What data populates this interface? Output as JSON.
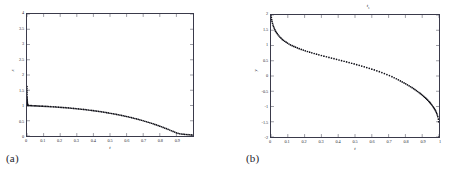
{
  "figure": {
    "background": "#ffffff",
    "ink": "#1a1a1a"
  },
  "panels": [
    {
      "id": "a",
      "caption": "(a)",
      "title": "",
      "chart_data": {
        "type": "scatter",
        "title": "",
        "xlabel": "t",
        "ylabel": "x",
        "xlim": [
          0,
          1
        ],
        "ylim": [
          0,
          4
        ],
        "xticks": [
          0,
          0.1,
          0.2,
          0.3,
          0.4,
          0.5,
          0.6,
          0.7,
          0.8,
          0.9
        ],
        "xticklabels": [
          "0",
          "0.1",
          "0.2",
          "0.3",
          "0.4",
          "0.5",
          "0.6",
          "0.7",
          "0.8",
          "0.9"
        ],
        "yticks": [
          0,
          0.5,
          1,
          1.5,
          2,
          2.5,
          3,
          3.5,
          4
        ],
        "yticklabels": [
          "0",
          "0.5",
          "1",
          "1.5",
          "2",
          "2.5",
          "3",
          "3.5",
          "4"
        ],
        "grid": false,
        "legend": false,
        "marker": "dot",
        "series": [
          {
            "name": "spike",
            "comment": "near-vertical cluster of points at t=0 descending from ~1.62 to ~1.0",
            "x": [
              0.0,
              0.0,
              0.0,
              0.0,
              0.0,
              0.0,
              0.001,
              0.001,
              0.001,
              0.002,
              0.002,
              0.002,
              0.003,
              0.003,
              0.004,
              0.004,
              0.005
            ],
            "y": [
              1.62,
              1.55,
              1.48,
              1.42,
              1.36,
              1.3,
              1.25,
              1.2,
              1.16,
              1.12,
              1.09,
              1.07,
              1.05,
              1.04,
              1.02,
              1.01,
              1.0
            ]
          },
          {
            "name": "decay",
            "comment": "dotted branch from (0,1.0) decaying slowly then steeply to (1,0.03)",
            "x": [
              0.005,
              0.012,
              0.02,
              0.028,
              0.036,
              0.044,
              0.052,
              0.06,
              0.068,
              0.076,
              0.085,
              0.094,
              0.103,
              0.112,
              0.121,
              0.13,
              0.14,
              0.15,
              0.16,
              0.17,
              0.18,
              0.19,
              0.2,
              0.21,
              0.22,
              0.23,
              0.24,
              0.25,
              0.26,
              0.27,
              0.28,
              0.29,
              0.3,
              0.31,
              0.32,
              0.33,
              0.34,
              0.35,
              0.36,
              0.37,
              0.38,
              0.39,
              0.4,
              0.41,
              0.42,
              0.43,
              0.44,
              0.45,
              0.46,
              0.47,
              0.48,
              0.49,
              0.5,
              0.51,
              0.52,
              0.53,
              0.54,
              0.55,
              0.56,
              0.57,
              0.58,
              0.59,
              0.6,
              0.61,
              0.62,
              0.63,
              0.64,
              0.65,
              0.66,
              0.67,
              0.68,
              0.69,
              0.7,
              0.71,
              0.72,
              0.73,
              0.74,
              0.75,
              0.76,
              0.77,
              0.78,
              0.79,
              0.8,
              0.81,
              0.82,
              0.83,
              0.84,
              0.85,
              0.86,
              0.87,
              0.88,
              0.89,
              0.9,
              0.91,
              0.92,
              0.93,
              0.94,
              0.95,
              0.96,
              0.97,
              0.98,
              0.99,
              1.0
            ],
            "y": [
              1.0,
              0.998,
              0.996,
              0.994,
              0.992,
              0.99,
              0.988,
              0.986,
              0.984,
              0.982,
              0.979,
              0.977,
              0.974,
              0.972,
              0.969,
              0.966,
              0.963,
              0.96,
              0.956,
              0.953,
              0.949,
              0.945,
              0.941,
              0.937,
              0.933,
              0.929,
              0.924,
              0.92,
              0.915,
              0.91,
              0.905,
              0.9,
              0.894,
              0.889,
              0.883,
              0.877,
              0.871,
              0.865,
              0.858,
              0.852,
              0.845,
              0.838,
              0.831,
              0.823,
              0.816,
              0.808,
              0.8,
              0.792,
              0.783,
              0.775,
              0.766,
              0.757,
              0.747,
              0.738,
              0.728,
              0.718,
              0.707,
              0.697,
              0.686,
              0.675,
              0.663,
              0.651,
              0.639,
              0.627,
              0.614,
              0.601,
              0.588,
              0.574,
              0.56,
              0.546,
              0.531,
              0.516,
              0.5,
              0.484,
              0.468,
              0.451,
              0.434,
              0.417,
              0.399,
              0.38,
              0.362,
              0.342,
              0.323,
              0.303,
              0.282,
              0.261,
              0.24,
              0.218,
              0.196,
              0.173,
              0.15,
              0.127,
              0.103,
              0.086,
              0.074,
              0.066,
              0.06,
              0.054,
              0.049,
              0.044,
              0.04,
              0.036,
              0.032
            ]
          }
        ]
      }
    },
    {
      "id": "b",
      "caption": "(b)",
      "chart_data": {
        "type": "scatter",
        "title": "t",
        "title_sub": "s",
        "xlabel": "t",
        "ylabel": "y",
        "xlim": [
          0,
          1
        ],
        "ylim": [
          -2,
          2
        ],
        "xticks": [
          0,
          0.1,
          0.2,
          0.3,
          0.4,
          0.5,
          0.6,
          0.7,
          0.8,
          0.9,
          1.0
        ],
        "xticklabels": [
          "0",
          "0.1",
          "0.2",
          "0.3",
          "0.4",
          "0.5",
          "0.6",
          "0.7",
          "0.8",
          "0.9",
          "1"
        ],
        "yticks": [
          -2,
          -1.5,
          -1,
          -0.5,
          0,
          0.5,
          1,
          1.5,
          2
        ],
        "yticklabels": [
          "-2",
          "-1.5",
          "-1",
          "-0.5",
          "0",
          "0.5",
          "1",
          "1.5",
          "2"
        ],
        "grid": false,
        "legend": false,
        "marker": "dot",
        "series": [
          {
            "name": "descent",
            "comment": "monotone decreasing dotted curve from (0,2) with steep initial drop, gentle middle, steep final fall to (1,-2)",
            "x": [
              0.0,
              0.002,
              0.004,
              0.006,
              0.009,
              0.012,
              0.015,
              0.019,
              0.023,
              0.027,
              0.032,
              0.037,
              0.042,
              0.048,
              0.054,
              0.06,
              0.067,
              0.074,
              0.082,
              0.09,
              0.098,
              0.107,
              0.116,
              0.126,
              0.136,
              0.146,
              0.157,
              0.168,
              0.18,
              0.192,
              0.204,
              0.217,
              0.23,
              0.243,
              0.257,
              0.271,
              0.285,
              0.3,
              0.315,
              0.33,
              0.345,
              0.36,
              0.375,
              0.39,
              0.405,
              0.42,
              0.435,
              0.45,
              0.465,
              0.48,
              0.495,
              0.51,
              0.525,
              0.54,
              0.555,
              0.57,
              0.585,
              0.6,
              0.615,
              0.63,
              0.645,
              0.66,
              0.675,
              0.69,
              0.705,
              0.72,
              0.733,
              0.746,
              0.758,
              0.77,
              0.781,
              0.792,
              0.802,
              0.812,
              0.822,
              0.831,
              0.84,
              0.849,
              0.857,
              0.865,
              0.873,
              0.881,
              0.888,
              0.895,
              0.902,
              0.909,
              0.915,
              0.921,
              0.927,
              0.933,
              0.939,
              0.944,
              0.949,
              0.954,
              0.959,
              0.964,
              0.968,
              0.972,
              0.976,
              0.98,
              0.984,
              0.987,
              0.99,
              0.993,
              0.996,
              0.998,
              1.0
            ],
            "y": [
              2.0,
              1.92,
              1.85,
              1.79,
              1.73,
              1.67,
              1.62,
              1.57,
              1.52,
              1.47,
              1.43,
              1.39,
              1.35,
              1.31,
              1.27,
              1.24,
              1.2,
              1.17,
              1.14,
              1.11,
              1.08,
              1.05,
              1.02,
              0.995,
              0.97,
              0.945,
              0.92,
              0.896,
              0.872,
              0.849,
              0.826,
              0.803,
              0.781,
              0.759,
              0.737,
              0.715,
              0.694,
              0.672,
              0.651,
              0.63,
              0.609,
              0.588,
              0.567,
              0.546,
              0.525,
              0.504,
              0.483,
              0.462,
              0.44,
              0.418,
              0.396,
              0.373,
              0.35,
              0.326,
              0.302,
              0.277,
              0.251,
              0.225,
              0.198,
              0.17,
              0.141,
              0.111,
              0.08,
              0.047,
              0.013,
              -0.022,
              -0.056,
              -0.091,
              -0.125,
              -0.16,
              -0.193,
              -0.226,
              -0.258,
              -0.29,
              -0.322,
              -0.353,
              -0.384,
              -0.416,
              -0.446,
              -0.477,
              -0.508,
              -0.54,
              -0.57,
              -0.601,
              -0.633,
              -0.666,
              -0.696,
              -0.727,
              -0.759,
              -0.793,
              -0.827,
              -0.858,
              -0.891,
              -0.925,
              -0.961,
              -0.999,
              -1.032,
              -1.067,
              -1.104,
              -1.146,
              -1.191,
              -1.231,
              -1.278,
              -1.333,
              -1.413,
              -1.5,
              -2.0
            ]
          }
        ]
      }
    }
  ]
}
